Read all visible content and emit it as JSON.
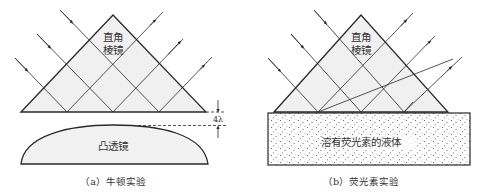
{
  "figure": {
    "panel_a": {
      "prism_label_line1": "直角",
      "prism_label_line2": "棱镜",
      "lens_label": "凸透镜",
      "gap_label": "4λ",
      "caption": "（a）牛顿实验"
    },
    "panel_b": {
      "prism_label_line1": "直角",
      "prism_label_line2": "棱镜",
      "liquid_label": "溶有荧光素的液体",
      "caption": "（b）荧光素实验"
    },
    "colors": {
      "line": "#2a2a2a",
      "prism_fill": "#f0f0f0",
      "lens_fill": "#f2f2f2",
      "dots": "#555555"
    }
  }
}
